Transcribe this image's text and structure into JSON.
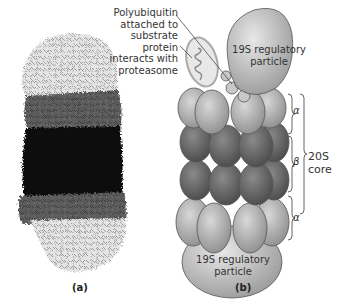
{
  "figure": {
    "panels": [
      {
        "id": "a",
        "label": "(a)",
        "description": "space-filling structure of proteasome"
      },
      {
        "id": "b",
        "label": "(b)",
        "description": "schematic of 26S proteasome"
      }
    ],
    "annotation": {
      "lines": [
        "Polyubiquitin",
        "attached to",
        "substrate protein",
        "interacts with",
        "proteasome"
      ]
    },
    "top_cap": {
      "lines": [
        "19S regulatory",
        "particle"
      ]
    },
    "bottom_cap": {
      "lines": [
        "19S regulatory",
        "particle"
      ]
    },
    "rings": {
      "alpha_top": "α",
      "beta": "β",
      "alpha_bottom": "α"
    },
    "core": {
      "lines": [
        "20S",
        "core"
      ]
    },
    "colors": {
      "cap_light": "#d9d9d9",
      "alpha_ring": "#bdbdbd",
      "beta_ring": "#6f6f6f",
      "structure_light": "#e6e6e6",
      "structure_mid": "#5a5a5a",
      "structure_dark": "#111111"
    }
  }
}
